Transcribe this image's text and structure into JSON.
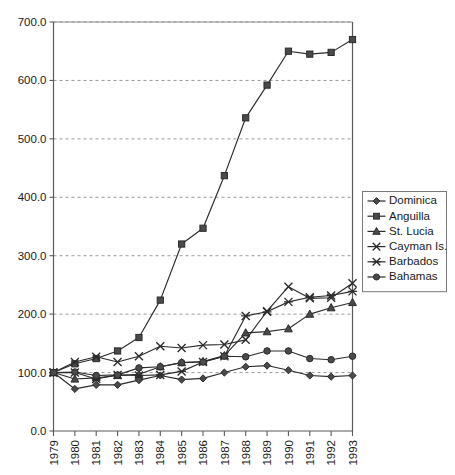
{
  "chart_data": {
    "type": "line",
    "title": "",
    "subtitle": "",
    "xlabel": "",
    "ylabel": "",
    "grid": true,
    "legend_position": "right",
    "xlim": [
      1979,
      1993
    ],
    "ylim": [
      0.0,
      700.0
    ],
    "y_tick_step": 100.0,
    "y_ticks": [
      "0.0",
      "100.0",
      "200.0",
      "300.0",
      "400.0",
      "500.0",
      "600.0",
      "700.0"
    ],
    "y_tick_values": [
      0,
      100,
      200,
      300,
      400,
      500,
      600,
      700
    ],
    "categories": [
      "1979",
      "1980",
      "1981",
      "1982",
      "1983",
      "1984",
      "1985",
      "1986",
      "1987",
      "1988",
      "1989",
      "1990",
      "1991",
      "1992",
      "1993"
    ],
    "x": [
      1979,
      1980,
      1981,
      1982,
      1983,
      1984,
      1985,
      1986,
      1987,
      1988,
      1989,
      1990,
      1991,
      1992,
      1993
    ],
    "series": [
      {
        "name": "Dominica",
        "marker": "diamond",
        "values": [
          100,
          72,
          79,
          79,
          87,
          95,
          88,
          90,
          100,
          110,
          112,
          104,
          95,
          93,
          95
        ]
      },
      {
        "name": "Anguilla",
        "marker": "square",
        "values": [
          100,
          115,
          124,
          137,
          160,
          224,
          320,
          347,
          437,
          536,
          592,
          650,
          645,
          648,
          670
        ]
      },
      {
        "name": "St. Lucia",
        "marker": "triangle",
        "values": [
          100,
          89,
          91,
          95,
          97,
          110,
          117,
          119,
          129,
          168,
          170,
          175,
          200,
          211,
          220
        ]
      },
      {
        "name": "Cayman Is.",
        "marker": "cross",
        "values": [
          100,
          118,
          127,
          118,
          128,
          145,
          142,
          147,
          148,
          156,
          205,
          247,
          227,
          228,
          253
        ]
      },
      {
        "name": "Barbados",
        "marker": "star",
        "values": [
          100,
          100,
          89,
          96,
          95,
          96,
          102,
          118,
          128,
          197,
          204,
          221,
          229,
          232,
          239
        ]
      },
      {
        "name": "Bahamas",
        "marker": "circle",
        "values": [
          100,
          101,
          95,
          96,
          108,
          110,
          117,
          118,
          128,
          127,
          137,
          137,
          124,
          122,
          128
        ]
      }
    ]
  },
  "legend": {
    "items": [
      {
        "label": "Dominica",
        "marker": "diamond"
      },
      {
        "label": "Anguilla",
        "marker": "square"
      },
      {
        "label": "St. Lucia",
        "marker": "triangle"
      },
      {
        "label": "Cayman Is.",
        "marker": "cross"
      },
      {
        "label": "Barbados",
        "marker": "star"
      },
      {
        "label": "Bahamas",
        "marker": "circle"
      }
    ]
  },
  "colors": {
    "line": "#2b2b2b",
    "marker_fill": "#4a4a4a",
    "grid": "#8d8d8d",
    "axis": "#5a5a5a",
    "background": "#ffffff",
    "text": "#1a1a1a"
  }
}
